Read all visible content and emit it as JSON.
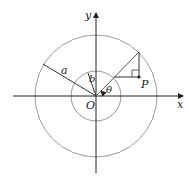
{
  "diagram": {
    "labels": {
      "x_axis": "x",
      "y_axis": "y",
      "origin": "O",
      "outer_radius": "a",
      "inner_radius": "b",
      "angle": "θ",
      "point": "P"
    },
    "colors": {
      "axis": "#222222",
      "circle": "#9a9a9a",
      "line": "#333333",
      "text": "#222222"
    },
    "geometry": {
      "origin": [
        96,
        96
      ],
      "outer_circle_radius": 61,
      "inner_circle_radius": 25
    }
  }
}
